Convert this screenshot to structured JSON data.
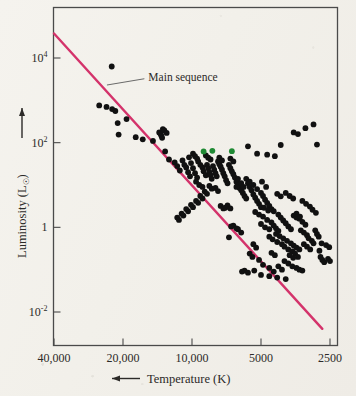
{
  "figure": {
    "kind": "scatter-plot"
  },
  "annotations": {
    "main_sequence_label": "Main sequence"
  },
  "axis": {
    "x_title": "Temperature (K)",
    "x_arrow": "left-arrow",
    "y_title_pre": "Luminosity (L",
    "y_title_sub": "☉",
    "y_title_post": ")",
    "y_arrow": "up-arrow"
  },
  "colors": {
    "main_sequence_line": "#d4336b",
    "point_primary": "#111111",
    "point_highlight": "#1f8a34",
    "frame": "#4a4a4a",
    "text": "#2c2a28",
    "page_background": "#f2f0ea"
  },
  "chart_data": {
    "type": "scatter",
    "title": "",
    "xlabel": "Temperature (K)",
    "ylabel": "Luminosity (L☉)",
    "xscale": "log-reversed",
    "yscale": "log",
    "xlim": [
      40000,
      2300
    ],
    "ylim": [
      0.0006,
      90000
    ],
    "grid": false,
    "legend": null,
    "x_ticks": [
      40000,
      20000,
      10000,
      5000,
      2500
    ],
    "x_tick_labels": [
      "40,000",
      "20,000",
      "10,000",
      "5000",
      "2500"
    ],
    "y_ticks": [
      10000,
      100,
      1,
      0.01
    ],
    "y_tick_labels": [
      "10⁴",
      "10²",
      "1",
      "10⁻²"
    ],
    "series": [
      {
        "name": "main sequence line",
        "type": "line",
        "color": "#d4336b",
        "points": [
          [
            40000,
            38000
          ],
          [
            2700,
            0.004
          ]
        ]
      },
      {
        "name": "stars",
        "type": "scatter",
        "color": "#111111",
        "points": [
          [
            22400,
            6300
          ],
          [
            25400,
            760
          ],
          [
            23600,
            700
          ],
          [
            22300,
            620
          ],
          [
            21600,
            560
          ],
          [
            21100,
            290
          ],
          [
            20900,
            155
          ],
          [
            19300,
            360
          ],
          [
            17600,
            135
          ],
          [
            16400,
            120
          ],
          [
            13900,
            175
          ],
          [
            13700,
            160
          ],
          [
            13600,
            145
          ],
          [
            13500,
            130
          ],
          [
            13400,
            210
          ],
          [
            13200,
            195
          ],
          [
            12900,
            170
          ],
          [
            14800,
            110
          ],
          [
            13100,
            62
          ],
          [
            12600,
            40
          ],
          [
            11900,
            34
          ],
          [
            11600,
            28
          ],
          [
            11300,
            22
          ],
          [
            11000,
            38
          ],
          [
            10800,
            30
          ],
          [
            10600,
            26
          ],
          [
            10400,
            20
          ],
          [
            10300,
            45
          ],
          [
            10100,
            33
          ],
          [
            9900,
            25
          ],
          [
            10200,
            16
          ],
          [
            9700,
            19
          ],
          [
            9500,
            15
          ],
          [
            9900,
            55
          ],
          [
            9700,
            48
          ],
          [
            9500,
            42
          ],
          [
            9400,
            36
          ],
          [
            9200,
            30
          ],
          [
            9000,
            26
          ],
          [
            8900,
            21
          ],
          [
            8700,
            17
          ],
          [
            9600,
            12
          ],
          [
            9300,
            10
          ],
          [
            9000,
            9
          ],
          [
            8600,
            30
          ],
          [
            8500,
            25
          ],
          [
            8400,
            20
          ],
          [
            8300,
            17
          ],
          [
            8200,
            14
          ],
          [
            8100,
            28
          ],
          [
            8000,
            23
          ],
          [
            7900,
            19
          ],
          [
            7800,
            16
          ],
          [
            8700,
            50
          ],
          [
            8500,
            44
          ],
          [
            8300,
            40
          ],
          [
            7700,
            36
          ],
          [
            7600,
            31
          ],
          [
            7500,
            27
          ],
          [
            7400,
            23
          ],
          [
            7300,
            19
          ],
          [
            7200,
            16
          ],
          [
            7100,
            13
          ],
          [
            7000,
            11
          ],
          [
            7600,
            44
          ],
          [
            7400,
            38
          ],
          [
            6900,
            30
          ],
          [
            6800,
            25
          ],
          [
            6700,
            21
          ],
          [
            6600,
            18
          ],
          [
            6500,
            15
          ],
          [
            6400,
            12
          ],
          [
            6300,
            10
          ],
          [
            6200,
            8.5
          ],
          [
            6800,
            42
          ],
          [
            6600,
            36
          ],
          [
            6400,
            9
          ],
          [
            6100,
            7.5
          ],
          [
            6000,
            6.5
          ],
          [
            5900,
            5.5
          ],
          [
            5800,
            4.8
          ],
          [
            6300,
            14
          ],
          [
            6100,
            11
          ],
          [
            5950,
            9
          ],
          [
            5700,
            11
          ],
          [
            5600,
            9
          ],
          [
            5500,
            7.5
          ],
          [
            5400,
            6
          ],
          [
            5300,
            5
          ],
          [
            5200,
            4.2
          ],
          [
            5100,
            3.6
          ],
          [
            5000,
            3
          ],
          [
            5800,
            14
          ],
          [
            5600,
            12
          ],
          [
            5400,
            10
          ],
          [
            5200,
            8
          ],
          [
            5000,
            6.5
          ],
          [
            4900,
            5.5
          ],
          [
            4800,
            4.5
          ],
          [
            4700,
            3.8
          ],
          [
            4600,
            3.2
          ],
          [
            4500,
            2.7
          ],
          [
            5300,
            2.3
          ],
          [
            5100,
            2.0
          ],
          [
            4900,
            1.8
          ],
          [
            4700,
            1.5
          ],
          [
            4500,
            1.3
          ],
          [
            4400,
            1.1
          ],
          [
            4300,
            0.95
          ],
          [
            4200,
            0.82
          ],
          [
            5000,
            1.2
          ],
          [
            4800,
            1.0
          ],
          [
            4600,
            0.9
          ],
          [
            4400,
            2.4
          ],
          [
            4200,
            2.0
          ],
          [
            4100,
            1.7
          ],
          [
            4000,
            1.45
          ],
          [
            3900,
            1.25
          ],
          [
            3800,
            1.05
          ],
          [
            3700,
            0.9
          ],
          [
            4300,
            0.7
          ],
          [
            4150,
            0.62
          ],
          [
            4000,
            0.55
          ],
          [
            3850,
            0.48
          ],
          [
            3700,
            0.42
          ],
          [
            3600,
            0.37
          ],
          [
            3500,
            0.33
          ],
          [
            3400,
            0.3
          ],
          [
            4600,
            0.6
          ],
          [
            4450,
            0.52
          ],
          [
            4250,
            0.45
          ],
          [
            4050,
            0.4
          ],
          [
            3950,
            0.35
          ],
          [
            3800,
            0.3
          ],
          [
            3650,
            0.27
          ],
          [
            3550,
            0.24
          ],
          [
            3450,
            0.2
          ],
          [
            3350,
            0.85
          ],
          [
            3250,
            0.75
          ],
          [
            3150,
            0.65
          ],
          [
            3400,
            1.6
          ],
          [
            3300,
            1.35
          ],
          [
            3200,
            1.15
          ],
          [
            3600,
            1.9
          ],
          [
            3500,
            1.7
          ],
          [
            3100,
            0.55
          ],
          [
            3000,
            0.48
          ],
          [
            2950,
            0.42
          ],
          [
            3250,
            0.4
          ],
          [
            3150,
            0.35
          ],
          [
            3050,
            0.3
          ],
          [
            2900,
            0.85
          ],
          [
            2850,
            0.7
          ],
          [
            2800,
            0.6
          ],
          [
            2750,
            0.2
          ],
          [
            2700,
            0.17
          ],
          [
            2650,
            0.15
          ],
          [
            2550,
            0.18
          ],
          [
            2500,
            0.16
          ],
          [
            3950,
            0.16
          ],
          [
            3800,
            0.14
          ],
          [
            3650,
            0.12
          ],
          [
            3500,
            0.11
          ],
          [
            3400,
            0.1
          ],
          [
            3300,
            0.095
          ],
          [
            4200,
            0.12
          ],
          [
            4050,
            0.1
          ],
          [
            4600,
            0.11
          ],
          [
            4400,
            0.09
          ],
          [
            5100,
            0.17
          ],
          [
            4900,
            0.13
          ],
          [
            5400,
            0.4
          ],
          [
            5250,
            0.33
          ],
          [
            5600,
            0.24
          ],
          [
            5450,
            0.2
          ],
          [
            5900,
            0.095
          ],
          [
            5700,
            0.085
          ],
          [
            6300,
            0.9
          ],
          [
            6100,
            0.75
          ],
          [
            6600,
            1.1
          ],
          [
            6400,
            0.95
          ],
          [
            7000,
            3.3
          ],
          [
            6800,
            2.8
          ],
          [
            7500,
            3.2
          ],
          [
            7300,
            2.8
          ],
          [
            7900,
            8.5
          ],
          [
            7700,
            7.2
          ],
          [
            8400,
            9.5
          ],
          [
            8200,
            8.2
          ],
          [
            8800,
            7.0
          ],
          [
            8600,
            6.2
          ],
          [
            9200,
            5.5
          ],
          [
            9000,
            4.8
          ],
          [
            9600,
            4.2
          ],
          [
            9400,
            3.8
          ],
          [
            10100,
            3.4
          ],
          [
            9900,
            3.0
          ],
          [
            10600,
            2.7
          ],
          [
            10400,
            2.4
          ],
          [
            11100,
            2.1
          ],
          [
            10900,
            1.9
          ],
          [
            11600,
            1.7
          ],
          [
            11400,
            1.5
          ],
          [
            6750,
            1.05
          ],
          [
            7150,
            2.9
          ],
          [
            3450,
            160
          ],
          [
            3200,
            220
          ],
          [
            2950,
            270
          ],
          [
            3600,
            175
          ],
          [
            4100,
            88
          ],
          [
            2850,
            90
          ],
          [
            5700,
            82
          ],
          [
            5200,
            55
          ],
          [
            4700,
            52
          ],
          [
            4350,
            48
          ],
          [
            4950,
            12
          ],
          [
            4750,
            9
          ],
          [
            3900,
            6.5
          ],
          [
            3750,
            5.5
          ],
          [
            3620,
            4.8
          ],
          [
            3300,
            4.2
          ],
          [
            3180,
            3.6
          ],
          [
            3060,
            3.1
          ],
          [
            2980,
            2.6
          ],
          [
            2880,
            2.2
          ],
          [
            4850,
            2.9
          ],
          [
            4650,
            2.5
          ],
          [
            4250,
            6.2
          ],
          [
            4100,
            5.4
          ],
          [
            3500,
            2.1
          ],
          [
            3380,
            1.8
          ],
          [
            2720,
            0.42
          ],
          [
            2600,
            0.38
          ],
          [
            2520,
            0.34
          ],
          [
            2780,
            0.28
          ],
          [
            5000,
            0.075
          ],
          [
            4600,
            0.07
          ],
          [
            4250,
            0.065
          ],
          [
            3900,
            0.06
          ],
          [
            6050,
            0.09
          ],
          [
            3750,
            0.22
          ],
          [
            3620,
            0.19
          ],
          [
            5350,
            0.095
          ],
          [
            4500,
            0.25
          ],
          [
            4350,
            0.22
          ],
          [
            6900,
            0.58
          ]
        ]
      },
      {
        "name": "highlighted stars",
        "type": "scatter",
        "color": "#1f8a34",
        "points": [
          [
            8900,
            62
          ],
          [
            8150,
            64
          ],
          [
            6700,
            63
          ]
        ]
      }
    ],
    "annotations": [
      {
        "text": "Main sequence",
        "anchor_data": [
          23500,
          2300
        ],
        "label_data": [
          15500,
          2900
        ]
      }
    ]
  }
}
